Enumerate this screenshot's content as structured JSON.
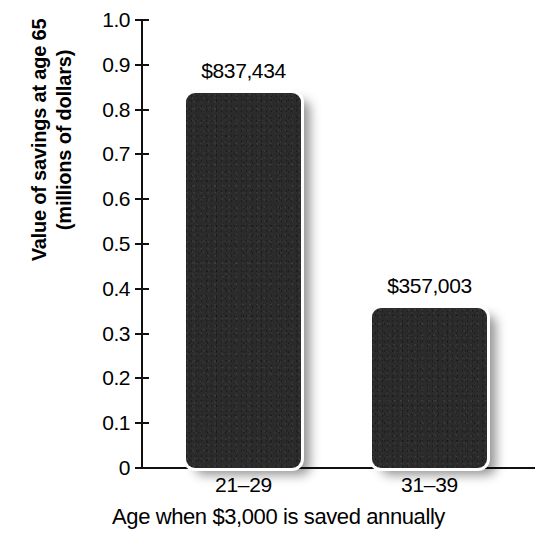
{
  "chart_data": {
    "type": "bar",
    "title": "",
    "subtitle": "",
    "xlabel": "Age when $3,000 is saved annually",
    "ylabel": "Value of savings at age 65 (millions of dollars)",
    "ylabel_line1": "Value of savings at age 65",
    "ylabel_line2": "(millions of dollars)",
    "categories": [
      "21–29",
      "31–39"
    ],
    "values": [
      0.837434,
      0.357003
    ],
    "value_labels": [
      "$837,434",
      "$357,003"
    ],
    "ylim": [
      0,
      1.0
    ],
    "ytick_values": [
      0,
      0.1,
      0.2,
      0.3,
      0.4,
      0.5,
      0.6,
      0.7,
      0.8,
      0.9,
      1.0
    ],
    "ytick_labels": [
      "0",
      "0.1",
      "0.2",
      "0.3",
      "0.4",
      "0.5",
      "0.6",
      "0.7",
      "0.8",
      "0.9",
      "1.0"
    ],
    "grid": false,
    "legend": false,
    "legend_position": "none",
    "bar_color": "#2b2b2b",
    "axis_color": "#111111",
    "background_color": "#ffffff"
  }
}
